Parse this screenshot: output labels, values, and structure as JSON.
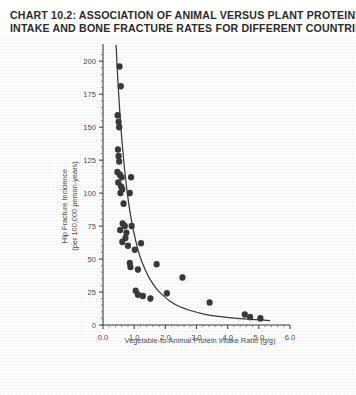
{
  "title": {
    "line1": "CHART 10.2: ASSOCIATION OF ANIMAL VERSUS PLANT PROTEIN",
    "line2": "INTAKE AND BONE FRACTURE RATES FOR DIFFERENT COUNTRIES"
  },
  "colors": {
    "ink": "#3a3a3a",
    "title_ink": "#2a2a2a",
    "background": "#ffffff",
    "point_fill": "#3a3a3a",
    "curve": "#3a3a3a"
  },
  "chart_data": {
    "type": "scatter",
    "title": "CHART 10.2: ASSOCIATION OF ANIMAL VERSUS PLANT PROTEIN INTAKE AND BONE FRACTURE RATES FOR DIFFERENT COUNTRIES",
    "xlabel": "Vegetable-to-Animal Protein Intake Ratio (g/g)",
    "ylabel": "Hip Fracture Incidence (per 100,000 person-years)",
    "ylabel_line1": "Hip Fracture Incidence",
    "ylabel_line2": "(per 100,000 person-years)",
    "xlim": [
      0.0,
      6.0
    ],
    "ylim": [
      0,
      210
    ],
    "xticks": [
      0.0,
      1.0,
      2.0,
      3.0,
      4.0,
      5.0,
      6.0
    ],
    "xtick_labels": [
      "0.0",
      "1.0",
      "2.0",
      "3.0",
      "4.0",
      "5.0",
      "6.0"
    ],
    "xminor_step": 0.2,
    "yticks": [
      0,
      25,
      50,
      75,
      100,
      125,
      150,
      175,
      200
    ],
    "ytick_labels": [
      "0",
      "25",
      "50",
      "75",
      "100",
      "125",
      "150",
      "175",
      "200"
    ],
    "yminor_step": 5,
    "grid": false,
    "legend": null,
    "marker": {
      "shape": "circle",
      "radius_px": 3.1
    },
    "points": [
      [
        0.53,
        196
      ],
      [
        0.57,
        181
      ],
      [
        0.47,
        159
      ],
      [
        0.5,
        154
      ],
      [
        0.52,
        150
      ],
      [
        0.48,
        133
      ],
      [
        0.5,
        128
      ],
      [
        0.52,
        124
      ],
      [
        0.46,
        116
      ],
      [
        0.54,
        114
      ],
      [
        0.6,
        112
      ],
      [
        0.49,
        108
      ],
      [
        0.58,
        105
      ],
      [
        0.62,
        103
      ],
      [
        0.56,
        100
      ],
      [
        0.9,
        112
      ],
      [
        0.86,
        100
      ],
      [
        0.66,
        92
      ],
      [
        0.63,
        77
      ],
      [
        0.7,
        75
      ],
      [
        0.55,
        72
      ],
      [
        0.75,
        70
      ],
      [
        0.72,
        66
      ],
      [
        0.62,
        63
      ],
      [
        0.92,
        75
      ],
      [
        0.8,
        60
      ],
      [
        1.02,
        57
      ],
      [
        1.22,
        62
      ],
      [
        0.86,
        47
      ],
      [
        0.88,
        44
      ],
      [
        1.12,
        42
      ],
      [
        1.72,
        46
      ],
      [
        1.05,
        26
      ],
      [
        1.12,
        23
      ],
      [
        1.28,
        22
      ],
      [
        1.52,
        20
      ],
      [
        2.05,
        24
      ],
      [
        2.55,
        36
      ],
      [
        3.42,
        17
      ],
      [
        4.55,
        8
      ],
      [
        4.72,
        6
      ],
      [
        5.05,
        5
      ]
    ],
    "fit_curve": {
      "label": "fitted decay curve",
      "type": "exponential-decay",
      "x_range": [
        0.42,
        5.35
      ],
      "points": [
        [
          0.42,
          212
        ],
        [
          0.5,
          176
        ],
        [
          0.58,
          148
        ],
        [
          0.66,
          126
        ],
        [
          0.74,
          108
        ],
        [
          0.82,
          93
        ],
        [
          0.9,
          81
        ],
        [
          1.0,
          69
        ],
        [
          1.1,
          59
        ],
        [
          1.2,
          51
        ],
        [
          1.35,
          42
        ],
        [
          1.5,
          35
        ],
        [
          1.7,
          28
        ],
        [
          1.9,
          23
        ],
        [
          2.15,
          18
        ],
        [
          2.45,
          14
        ],
        [
          2.8,
          11
        ],
        [
          3.2,
          8.5
        ],
        [
          3.7,
          6.5
        ],
        [
          4.3,
          5
        ],
        [
          4.9,
          4
        ],
        [
          5.35,
          3.4
        ]
      ]
    }
  }
}
